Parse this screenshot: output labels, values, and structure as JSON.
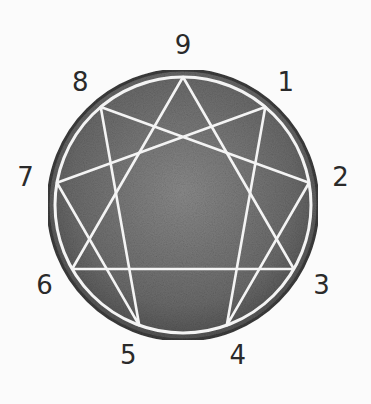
{
  "diagram": {
    "type": "enneagram",
    "colors": {
      "background": "#fbfbfb",
      "circle_fill": "#6e6e6e",
      "circle_edge": "#3c3c3c",
      "lines": "#f4f4f4",
      "labels": "#2a2a2a"
    },
    "points": [
      {
        "n": "9",
        "label": "9"
      },
      {
        "n": "1",
        "label": "1"
      },
      {
        "n": "2",
        "label": "2"
      },
      {
        "n": "3",
        "label": "3"
      },
      {
        "n": "4",
        "label": "4"
      },
      {
        "n": "5",
        "label": "5"
      },
      {
        "n": "6",
        "label": "6"
      },
      {
        "n": "7",
        "label": "7"
      },
      {
        "n": "8",
        "label": "8"
      }
    ],
    "triangle": [
      "9",
      "3",
      "6"
    ],
    "hexad": [
      "1",
      "4",
      "2",
      "8",
      "5",
      "7"
    ]
  }
}
